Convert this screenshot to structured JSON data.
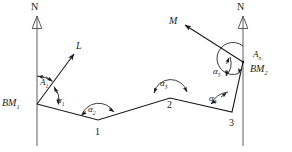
{
  "figure": {
    "type": "surveying-traverse-diagram",
    "stroke_color": "#1a1a1a",
    "meridian_color": "#8c8c8c",
    "background": "#ffffff",
    "width": 292,
    "height": 152
  },
  "north_arrows": [
    {
      "name": "north-left",
      "label": "N",
      "x": 37,
      "label_x": 32,
      "label_y": 3
    },
    {
      "name": "north-right",
      "label": "N",
      "x": 243,
      "label_x": 238,
      "label_y": 3
    }
  ],
  "stations": [
    {
      "id": "bm1",
      "label": "BM",
      "sub": "1",
      "x": 37,
      "y": 104,
      "label_x": 2,
      "label_y": 99
    },
    {
      "id": "p1",
      "label": "1",
      "x": 98,
      "y": 120,
      "label_x": 95,
      "label_y": 128
    },
    {
      "id": "p2",
      "label": "2",
      "x": 170,
      "y": 98,
      "label_x": 167,
      "label_y": 101
    },
    {
      "id": "p3",
      "label": "3",
      "x": 232,
      "y": 112,
      "label_x": 229,
      "label_y": 119
    },
    {
      "id": "bm2",
      "label": "BM",
      "sub": "2",
      "x": 243,
      "y": 62,
      "label_x": 251,
      "label_y": 66
    }
  ],
  "reference_targets": [
    {
      "id": "target-L",
      "label": "L",
      "tip_x": 73,
      "tip_y": 53,
      "label_x": 76,
      "label_y": 42
    },
    {
      "id": "target-M",
      "label": "M",
      "tip_x": 186,
      "tip_y": 26,
      "label_x": 170,
      "label_y": 17
    }
  ],
  "angles": [
    {
      "id": "A1",
      "label": "A",
      "sub": "1",
      "label_x": 40,
      "label_y": 79,
      "note": "azimuth from north meridian at BM1 to line L"
    },
    {
      "id": "a1",
      "label": "α",
      "sub": "1",
      "label_x": 57,
      "label_y": 97,
      "note": "angle at BM1 between line L and leg BM1-1"
    },
    {
      "id": "a2",
      "label": "α",
      "sub": "2",
      "label_x": 88,
      "label_y": 106,
      "note": "interior angle at station 1"
    },
    {
      "id": "a3",
      "label": "α",
      "sub": "3",
      "label_x": 160,
      "label_y": 80,
      "note": "interior angle at station 2"
    },
    {
      "id": "a4",
      "label": "α",
      "sub": "4",
      "label_x": 209,
      "label_y": 95,
      "note": "interior angle at station 3"
    },
    {
      "id": "a5",
      "label": "α",
      "sub": "5",
      "label_x": 214,
      "label_y": 68,
      "note": "angle at BM2 between leg 3-BM2 and line M"
    },
    {
      "id": "An",
      "label": "A",
      "sub": "n",
      "label_x": 254,
      "label_y": 53,
      "note": "azimuth from north meridian at BM2 to line M"
    }
  ],
  "traverse_legs": [
    {
      "from": "bm1",
      "to": "p1"
    },
    {
      "from": "p1",
      "to": "p2"
    },
    {
      "from": "p2",
      "to": "p3"
    },
    {
      "from": "p3",
      "to": "bm2"
    }
  ]
}
